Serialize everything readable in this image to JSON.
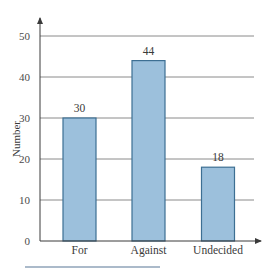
{
  "chart_data": {
    "type": "bar",
    "title": "",
    "xlabel": "",
    "ylabel": "Number",
    "categories": [
      "For",
      "Against",
      "Undecided"
    ],
    "values": [
      30,
      44,
      18
    ],
    "data_labels": [
      "30",
      "44",
      "18"
    ],
    "ylim": [
      0,
      50
    ],
    "yticks": [
      0,
      10,
      20,
      30,
      40,
      50
    ],
    "grid": true,
    "legend": null
  },
  "colors": {
    "bar_fill": "#9cc0dc",
    "bar_stroke": "#3d6f93",
    "grid": "#8a8a8a",
    "axis": "#4a4a4a",
    "footer_rule": "#8fa3b8"
  }
}
